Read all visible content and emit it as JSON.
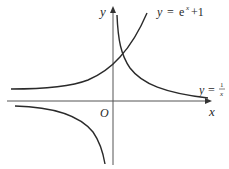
{
  "diagram": {
    "type": "function-graph",
    "axes": {
      "x_label": "x",
      "y_label": "y",
      "origin_label": "O"
    },
    "curves": [
      {
        "name": "exp-curve",
        "label_y": "y",
        "label_eq": "=",
        "label_rhs": "e",
        "label_sup": "x",
        "label_tail": "+1",
        "expression": "y = e^x + 1"
      },
      {
        "name": "reciprocal-curve",
        "label_y": "y",
        "label_eq": "=",
        "label_num": "1",
        "label_den": "x",
        "expression": "y = 1/x"
      }
    ],
    "colors": {
      "axis": "#555555",
      "curve": "#2a2a2a",
      "background": "#ffffff"
    }
  }
}
